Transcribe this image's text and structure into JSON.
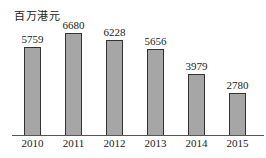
{
  "chart_data": {
    "type": "bar",
    "title": "",
    "unit_label": "百万港元",
    "xlabel": "",
    "ylabel": "百万港元",
    "categories": [
      "2010",
      "2011",
      "2012",
      "2013",
      "2014",
      "2015"
    ],
    "values": [
      5759,
      6680,
      6228,
      5656,
      3979,
      2780
    ],
    "value_labels": [
      "5759",
      "6680",
      "6228",
      "5656",
      "3979",
      "2780"
    ],
    "ylim": [
      0,
      7500
    ],
    "grid": false,
    "legend": null,
    "bar_color": "#a6a6a6"
  }
}
